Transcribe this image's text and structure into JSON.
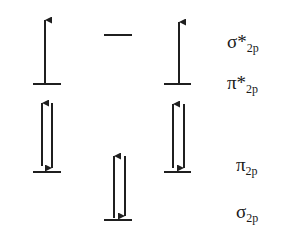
{
  "diagram": {
    "type": "molecular-orbital-energy-levels",
    "color": "#1f1f1f",
    "levels": [
      {
        "id": "sigma-star-2p",
        "symbol": "σ*",
        "subscript": "2p",
        "label_y": 36,
        "line_y": 35,
        "columns": [
          "middle"
        ],
        "electrons": {
          "middle": []
        }
      },
      {
        "id": "pi-star-2p",
        "symbol": "π*",
        "subscript": "2p",
        "label_y": 76,
        "line_y": 84,
        "columns": [
          "left",
          "right"
        ],
        "electrons": {
          "left": [
            "up"
          ],
          "right": [
            "up"
          ]
        }
      },
      {
        "id": "pi-2p",
        "symbol": "π",
        "subscript": "2p",
        "label_y": 157,
        "line_y": 172,
        "columns": [
          "left",
          "right"
        ],
        "electrons": {
          "left": [
            "up",
            "down"
          ],
          "right": [
            "up",
            "down"
          ]
        }
      },
      {
        "id": "sigma-2p",
        "symbol": "σ",
        "subscript": "2p",
        "label_y": 204,
        "line_y": 220,
        "columns": [
          "middle"
        ],
        "electrons": {
          "middle": [
            "up",
            "down"
          ]
        }
      }
    ]
  },
  "labels": {
    "sigma_star_2p": {
      "symbol": "σ*",
      "sub": "2p"
    },
    "pi_star_2p": {
      "symbol": "π*",
      "sub": "2p"
    },
    "pi_2p": {
      "symbol": "π",
      "sub": "2p"
    },
    "sigma_2p": {
      "symbol": "σ",
      "sub": "2p"
    }
  }
}
